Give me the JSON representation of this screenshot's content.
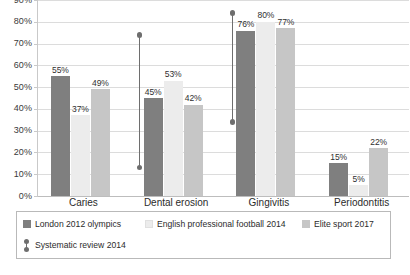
{
  "chart_data": {
    "type": "bar",
    "title": "",
    "subtitle": "",
    "xlabel": "",
    "ylabel": "",
    "ylim": [
      0,
      90
    ],
    "grid": true,
    "legend_position": "bottom",
    "categories": [
      "Caries",
      "Dental erosion",
      "Gingivitis",
      "Periodontitis"
    ],
    "y_ticks": [
      "0%",
      "10%",
      "20%",
      "30%",
      "40%",
      "50%",
      "60%",
      "70%",
      "80%",
      "90%"
    ],
    "y_tick_values": [
      0,
      10,
      20,
      30,
      40,
      50,
      60,
      70,
      80,
      90
    ],
    "series": [
      {
        "name": "London 2012 olympics",
        "color": "#7f7f7f",
        "values": [
          55,
          45,
          76,
          15
        ],
        "labels": [
          "55%",
          "45%",
          "76%",
          "15%"
        ]
      },
      {
        "name": "English professional football 2014",
        "color": "#ececec",
        "values": [
          37,
          53,
          80,
          5
        ],
        "labels": [
          "37%",
          "53%",
          "80%",
          "5%"
        ]
      },
      {
        "name": "Elite sport 2017",
        "color": "#c6c6c6",
        "values": [
          49,
          42,
          77,
          22
        ],
        "labels": [
          "49%",
          "42%",
          "77%",
          "22%"
        ]
      }
    ],
    "range_series": {
      "name": "Systematic review 2014",
      "color": "#6e6e6e",
      "ranges": [
        {
          "category": "Caries",
          "low": null,
          "high": null
        },
        {
          "category": "Dental erosion",
          "low": 13,
          "high": 74
        },
        {
          "category": "Gingivitis",
          "low": 34,
          "high": 84
        },
        {
          "category": "Periodontitis",
          "low": null,
          "high": null
        }
      ]
    }
  },
  "legend": {
    "items": [
      {
        "label": "London 2012 olympics",
        "type": "swatch",
        "series": 0
      },
      {
        "label": "English professional football 2014",
        "type": "swatch",
        "series": 1
      },
      {
        "label": "Elite sport 2017",
        "type": "swatch",
        "series": 2
      },
      {
        "label": "Systematic review 2014",
        "type": "range-marker",
        "series": 3
      }
    ]
  }
}
